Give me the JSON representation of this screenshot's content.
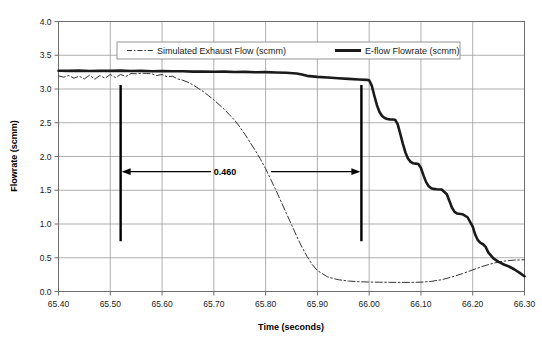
{
  "chart_data": {
    "type": "line",
    "title": "",
    "xlabel": "Time (seconds)",
    "ylabel": "Flowrate (scmm)",
    "xlim": [
      65.4,
      66.3
    ],
    "ylim": [
      0.0,
      4.0
    ],
    "xticks": [
      "65.40",
      "65.50",
      "65.60",
      "65.70",
      "65.80",
      "65.90",
      "66.00",
      "66.10",
      "66.20",
      "66.30"
    ],
    "xtick_values": [
      65.4,
      65.5,
      65.6,
      65.7,
      65.8,
      65.9,
      66.0,
      66.1,
      66.2,
      66.3
    ],
    "yticks": [
      "0.0",
      "0.5",
      "1.0",
      "1.5",
      "2.0",
      "2.5",
      "3.0",
      "3.5",
      "4.0"
    ],
    "ytick_values": [
      0.0,
      0.5,
      1.0,
      1.5,
      2.0,
      2.5,
      3.0,
      3.5,
      4.0
    ],
    "grid": true,
    "legend_position": "top-inside",
    "series": [
      {
        "name": "Simulated Exhaust Flow (scmm)",
        "style": "dash-dot",
        "color": "#333333",
        "width": 1,
        "x": [
          65.4,
          65.41,
          65.42,
          65.43,
          65.44,
          65.45,
          65.46,
          65.47,
          65.48,
          65.49,
          65.5,
          65.51,
          65.52,
          65.53,
          65.54,
          65.55,
          65.56,
          65.57,
          65.58,
          65.59,
          65.6,
          65.61,
          65.62,
          65.63,
          65.64,
          65.65,
          65.66,
          65.67,
          65.68,
          65.69,
          65.7,
          65.71,
          65.72,
          65.73,
          65.74,
          65.75,
          65.76,
          65.77,
          65.78,
          65.79,
          65.8,
          65.81,
          65.82,
          65.83,
          65.84,
          65.85,
          65.86,
          65.87,
          65.88,
          65.89,
          65.9,
          65.92,
          65.94,
          65.96,
          65.98,
          66.0,
          66.02,
          66.04,
          66.06,
          66.08,
          66.1,
          66.12,
          66.14,
          66.16,
          66.18,
          66.2,
          66.22,
          66.24,
          66.26,
          66.28,
          66.3
        ],
        "y": [
          3.195,
          3.175,
          3.2,
          3.16,
          3.19,
          3.15,
          3.205,
          3.145,
          3.2,
          3.16,
          3.215,
          3.17,
          3.215,
          3.185,
          3.23,
          3.225,
          3.235,
          3.23,
          3.225,
          3.2,
          3.215,
          3.18,
          3.19,
          3.15,
          3.13,
          3.1,
          3.06,
          3.01,
          2.96,
          2.9,
          2.84,
          2.77,
          2.7,
          2.62,
          2.54,
          2.44,
          2.33,
          2.21,
          2.09,
          1.96,
          1.82,
          1.66,
          1.5,
          1.33,
          1.16,
          0.99,
          0.82,
          0.66,
          0.52,
          0.4,
          0.31,
          0.215,
          0.175,
          0.155,
          0.145,
          0.14,
          0.138,
          0.136,
          0.135,
          0.135,
          0.138,
          0.15,
          0.175,
          0.215,
          0.265,
          0.32,
          0.375,
          0.42,
          0.45,
          0.465,
          0.47
        ]
      },
      {
        "name": "E-flow Flowrate (scmm)",
        "style": "solid",
        "color": "#1a1a1a",
        "width": 2.6,
        "x": [
          65.4,
          65.42,
          65.44,
          65.46,
          65.48,
          65.5,
          65.52,
          65.54,
          65.56,
          65.58,
          65.6,
          65.62,
          65.64,
          65.66,
          65.68,
          65.7,
          65.72,
          65.74,
          65.76,
          65.78,
          65.8,
          65.82,
          65.84,
          65.86,
          65.87,
          65.88,
          65.9,
          65.92,
          65.94,
          65.96,
          65.98,
          65.995,
          66.0,
          66.005,
          66.01,
          66.015,
          66.02,
          66.025,
          66.03,
          66.035,
          66.04,
          66.045,
          66.05,
          66.055,
          66.06,
          66.065,
          66.07,
          66.075,
          66.08,
          66.085,
          66.09,
          66.095,
          66.1,
          66.105,
          66.11,
          66.115,
          66.12,
          66.125,
          66.13,
          66.14,
          66.15,
          66.155,
          66.16,
          66.165,
          66.17,
          66.18,
          66.19,
          66.2,
          66.205,
          66.21,
          66.215,
          66.22,
          66.225,
          66.23,
          66.24,
          66.25,
          66.255,
          66.26,
          66.27,
          66.28,
          66.29,
          66.3
        ],
        "y": [
          3.27,
          3.268,
          3.272,
          3.266,
          3.27,
          3.268,
          3.272,
          3.266,
          3.268,
          3.264,
          3.266,
          3.262,
          3.264,
          3.258,
          3.26,
          3.256,
          3.258,
          3.252,
          3.254,
          3.248,
          3.25,
          3.244,
          3.24,
          3.23,
          3.215,
          3.195,
          3.18,
          3.17,
          3.16,
          3.15,
          3.14,
          3.135,
          3.13,
          3.05,
          2.9,
          2.76,
          2.66,
          2.6,
          2.57,
          2.555,
          2.55,
          2.548,
          2.545,
          2.48,
          2.34,
          2.19,
          2.06,
          1.97,
          1.92,
          1.9,
          1.895,
          1.89,
          1.83,
          1.72,
          1.62,
          1.56,
          1.53,
          1.52,
          1.515,
          1.51,
          1.44,
          1.34,
          1.24,
          1.18,
          1.155,
          1.145,
          1.1,
          0.96,
          0.84,
          0.76,
          0.72,
          0.7,
          0.66,
          0.58,
          0.49,
          0.44,
          0.42,
          0.4,
          0.37,
          0.33,
          0.28,
          0.225
        ]
      }
    ],
    "annotations": [
      {
        "name": "delay-measurement",
        "label": "0.460",
        "x_start": 65.52,
        "x_end": 65.985,
        "y": 1.775,
        "marker_top": 3.06,
        "marker_bottom": 0.745
      }
    ]
  },
  "legend": {
    "items": [
      {
        "label": "Simulated Exhaust Flow (scmm)",
        "style": "dash-dot"
      },
      {
        "label": "E-flow Flowrate (scmm)",
        "style": "solid"
      }
    ]
  },
  "colors": {
    "grid": "#9a9a9a",
    "frame": "#6e6e6e",
    "background": "#ffffff",
    "series_simulated": "#333333",
    "series_eflow": "#1a1a1a",
    "text": "#1a1a1a"
  }
}
